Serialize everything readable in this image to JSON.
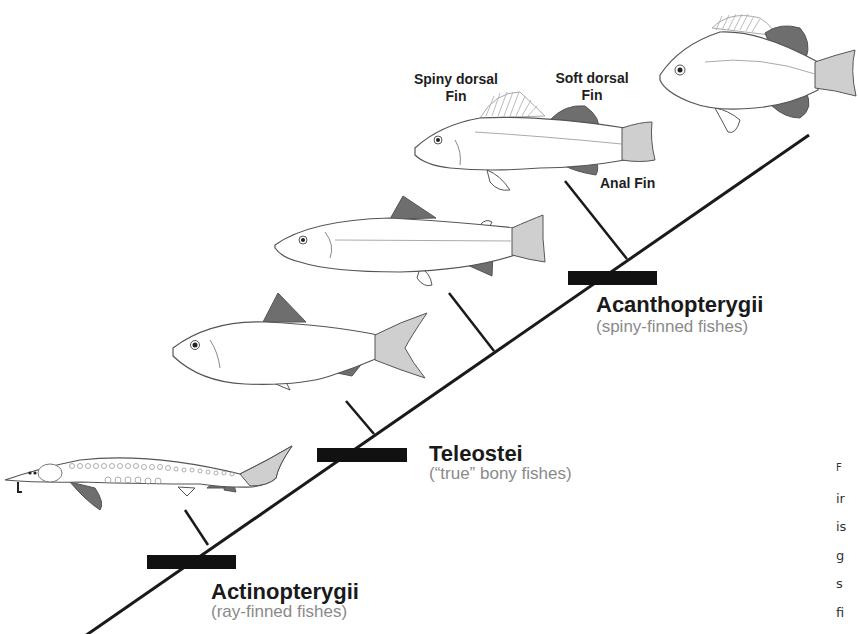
{
  "diagram": {
    "type": "cladogram",
    "colors": {
      "line": "#1a1a1a",
      "bar": "#111111",
      "fin_dark": "#6e6e6e",
      "fin_light": "#cfcfcf",
      "body_outline": "#555555",
      "subtitle_gray": "#8a8a8a"
    }
  },
  "clades": [
    {
      "name": "Actinopterygii",
      "subtitle": "(ray-finned fishes)"
    },
    {
      "name": "Teleostei",
      "subtitle": "(“true” bony fishes)"
    },
    {
      "name": "Acanthopterygii",
      "subtitle": "(spiny-finned fishes)"
    }
  ],
  "fishes": [
    {
      "name": "sturgeon"
    },
    {
      "name": "herring"
    },
    {
      "name": "trout"
    },
    {
      "name": "perch"
    },
    {
      "name": "sunfish"
    }
  ],
  "fin_labels": {
    "spiny_dorsal": [
      "Spiny dorsal",
      "Fin"
    ],
    "soft_dorsal": [
      "Soft dorsal",
      "Fin"
    ],
    "anal": "Anal Fin"
  },
  "caption_fragment": [
    "F",
    "ir",
    "is",
    "g",
    "s",
    "fi"
  ]
}
